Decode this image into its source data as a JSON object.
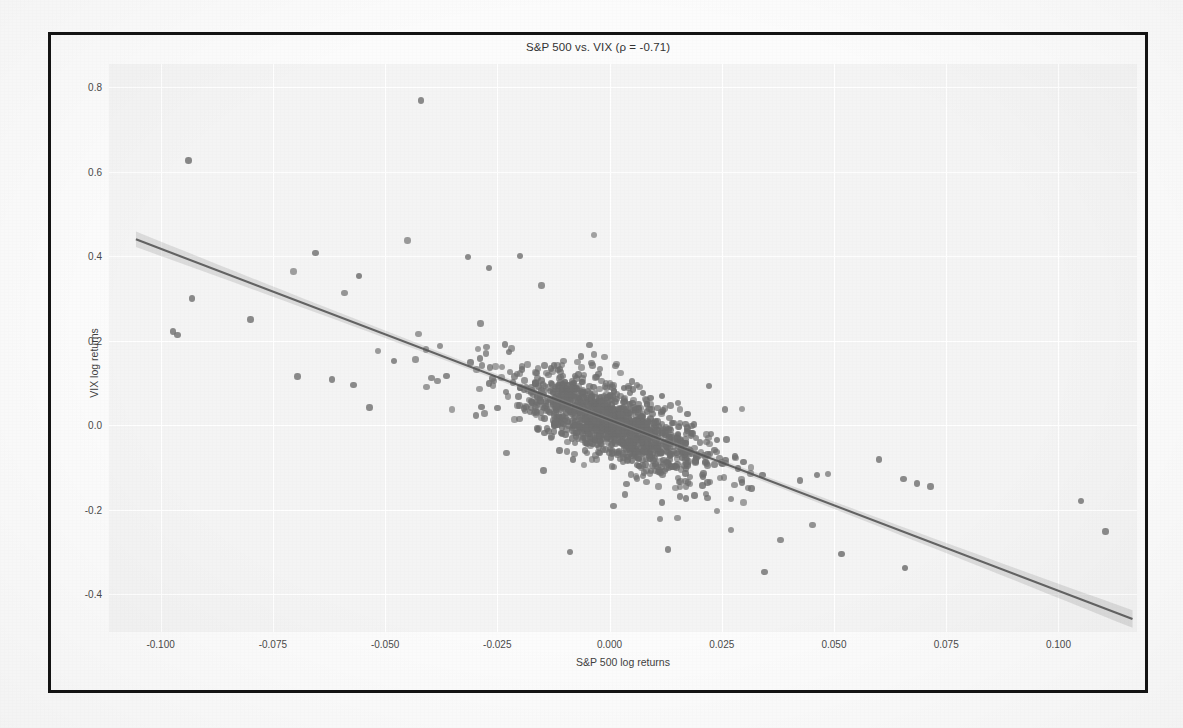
{
  "figure": {
    "title": "S&P 500 vs. VIX (ρ = -0.71)",
    "xlabel": "S&P 500 log returns",
    "ylabel": "VIX log returns",
    "plot_bg": "#f4f4f4",
    "grid_color": "#ffffff",
    "point_color": "#6f6f6f",
    "line_color": "#555555",
    "band_color": "#9a9a9a",
    "frame_color": "#141414"
  },
  "chart_data": {
    "type": "scatter",
    "title": "S&P 500 vs. VIX (ρ = -0.71)",
    "xlabel": "S&P 500 log returns",
    "ylabel": "VIX log returns",
    "correlation": -0.71,
    "xlim": [
      -0.1115,
      0.1175
    ],
    "ylim": [
      -0.49,
      0.855
    ],
    "xticks": [
      -0.1,
      -0.075,
      -0.05,
      -0.025,
      0.0,
      0.025,
      0.05,
      0.075,
      0.1
    ],
    "xticklabels": [
      "-0.100",
      "-0.075",
      "-0.050",
      "-0.025",
      "0.000",
      "0.025",
      "0.050",
      "0.075",
      "0.100"
    ],
    "yticks": [
      0.8,
      0.6,
      0.4,
      0.2,
      0.0,
      -0.2,
      -0.4
    ],
    "yticklabels": [
      "0.8",
      "0.6",
      "0.4",
      "0.2",
      "0.0",
      "-0.2",
      "-0.4"
    ],
    "grid": true,
    "legend": null,
    "regression": {
      "show": true,
      "slope": -4.05,
      "intercept": 0.0125,
      "x_start": -0.1055,
      "y_start": 0.4398,
      "x_end": 0.1165,
      "y_end": -0.4593,
      "ci_band": true,
      "ci_halfwidth_center": 0.006,
      "ci_halfwidth_ends": 0.021
    },
    "n_points": 1450,
    "point_generation": {
      "model": "bivariate-normal-plus-outliers",
      "sigma_x": 0.0098,
      "sigma_y": 0.0555,
      "rho": -0.71,
      "mean_x": 0.0004,
      "mean_y": 0.0025,
      "heavy_tail_factor": 2.35
    },
    "notable_points": [
      {
        "x": -0.042,
        "y": 0.768
      },
      {
        "x": -0.0655,
        "y": 0.408
      },
      {
        "x": -0.0315,
        "y": 0.398
      },
      {
        "x": -0.0268,
        "y": 0.372
      },
      {
        "x": -0.02,
        "y": 0.4
      },
      {
        "x": -0.093,
        "y": 0.3
      },
      {
        "x": -0.0972,
        "y": 0.222
      },
      {
        "x": -0.0962,
        "y": 0.213
      },
      {
        "x": -0.08,
        "y": 0.25
      },
      {
        "x": -0.0695,
        "y": 0.115
      },
      {
        "x": -0.0618,
        "y": 0.108
      },
      {
        "x": -0.057,
        "y": 0.095
      },
      {
        "x": -0.0535,
        "y": 0.042
      },
      {
        "x": -0.048,
        "y": 0.152
      },
      {
        "x": 0.0462,
        "y": -0.118
      },
      {
        "x": 0.06,
        "y": -0.082
      },
      {
        "x": 0.0655,
        "y": -0.128
      },
      {
        "x": 0.0685,
        "y": -0.138
      },
      {
        "x": 0.0715,
        "y": -0.145
      },
      {
        "x": 0.105,
        "y": -0.18
      },
      {
        "x": 0.1105,
        "y": -0.252
      },
      {
        "x": 0.0345,
        "y": -0.348
      },
      {
        "x": 0.013,
        "y": -0.295
      },
      {
        "x": -0.0088,
        "y": -0.3
      },
      {
        "x": 0.0222,
        "y": 0.092
      }
    ]
  },
  "background_page": {
    "description": "faint bleed-through text from printed page",
    "heading": "here's more...",
    "lines": [
      "the notebook reports the correlation between the two return series",
      "alongside the scatter and the fitted regression line with its interval",
      "as expected the relationship is strongly negative across the sample",
      "a one percent move lower in the index maps to a sizeable jump in volatility",
      "and the dispersion widens noticeably in the tails of the distribution",
      "which is why the band around the fit flares out toward both extremes",
      "further diagnostics follow in the next section of the analysis"
    ]
  }
}
